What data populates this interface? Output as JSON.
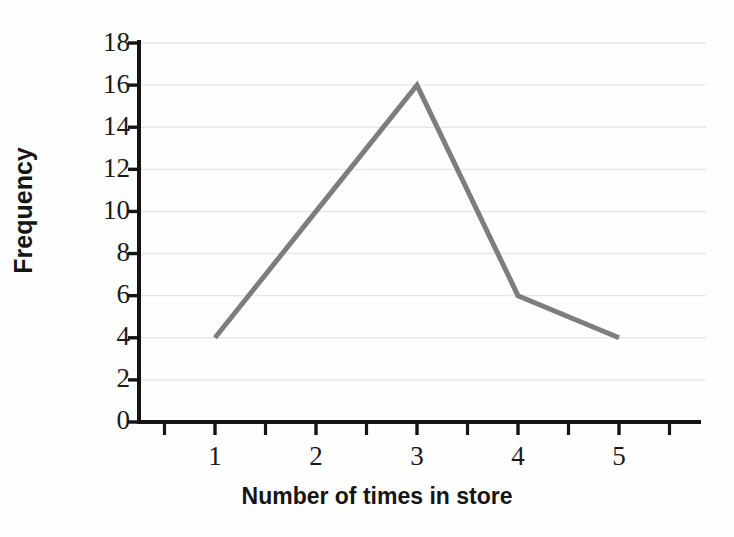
{
  "chart_data": {
    "type": "line",
    "title": "",
    "subtitle": "",
    "xlabel": "Number of times in store",
    "ylabel": "Frequency",
    "x": [
      1,
      2,
      3,
      4,
      5
    ],
    "values": [
      4,
      10,
      16,
      6,
      4
    ],
    "categories": [
      "1",
      "2",
      "3",
      "4",
      "5"
    ],
    "series": [
      {
        "name": "Frequency",
        "values": [
          4,
          10,
          16,
          6,
          4
        ],
        "color": "#808080"
      }
    ],
    "xlim": [
      0.5,
      5.8
    ],
    "ylim": [
      0,
      18
    ],
    "x_ticks": [
      1,
      2,
      3,
      4,
      5
    ],
    "x_tick_labels": [
      "1",
      "2",
      "3",
      "4",
      "5"
    ],
    "x_minor_ticks": [
      0.5,
      1.5,
      2.5,
      3.5,
      4.5,
      5.5
    ],
    "y_ticks": [
      0,
      2,
      4,
      6,
      8,
      10,
      12,
      14,
      16,
      18
    ],
    "y_tick_labels": [
      "0",
      "2",
      "4",
      "6",
      "8",
      "10",
      "12",
      "14",
      "16",
      "18"
    ],
    "grid": "horizontal",
    "grid_color": "#e4e6ec",
    "legend": "none",
    "line_color": "#7d7d7d",
    "line_width": 5,
    "markers": "none",
    "axis_color": "#141414",
    "background_color": "#fefefe",
    "annotations": []
  },
  "axes": {
    "y_label_text": "Frequency",
    "x_label_text": "Number of times in store"
  },
  "ticks": {
    "y": [
      "18",
      "16",
      "14",
      "12",
      "10",
      "8",
      "6",
      "4",
      "2",
      "0"
    ],
    "x": [
      "1",
      "2",
      "3",
      "4",
      "5"
    ]
  }
}
